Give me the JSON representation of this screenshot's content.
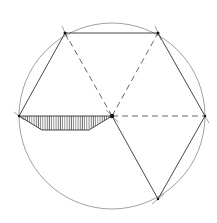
{
  "diagram": {
    "type": "geometric-construction",
    "colors": {
      "background": "#ffffff",
      "circle": "#888888",
      "solid_line": "#333333",
      "dashed_line": "#555555",
      "hatch": "#666666",
      "point": "#111111"
    },
    "circle": {
      "cx": 112,
      "cy": 116,
      "r": 93
    },
    "vertices": {
      "left": [
        19,
        116
      ],
      "top_left": [
        65,
        33
      ],
      "top_right": [
        158,
        33
      ],
      "right": [
        205,
        116
      ],
      "bottom_right": [
        158,
        199
      ],
      "center": [
        112,
        116
      ]
    },
    "trapezoid": {
      "points": [
        [
          19,
          116
        ],
        [
          112,
          116
        ],
        [
          89,
          130
        ],
        [
          42,
          130
        ]
      ]
    }
  }
}
